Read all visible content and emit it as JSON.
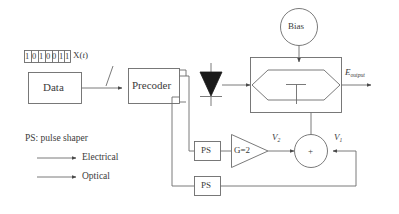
{
  "figure": {
    "type": "block-diagram"
  },
  "blocks": {
    "data": {
      "label": "Data"
    },
    "precoder": {
      "label": "Precoder"
    },
    "bias": {
      "label": "Bias"
    },
    "ps_upper": {
      "label": "PS"
    },
    "ps_lower": {
      "label": "PS"
    },
    "amplifier": {
      "label": "G=2",
      "gain": 2
    },
    "summer": {
      "label": "+"
    },
    "laser": {
      "name": "laser-diode"
    },
    "modulator": {
      "name": "mach-zehnder-modulator"
    }
  },
  "signals": {
    "bitstream": [
      "1",
      "0",
      "1",
      "0",
      "0",
      "1",
      "1"
    ],
    "bitstream_label": "X(t)",
    "bitstream_label_base": "X",
    "bitstream_label_var": "t",
    "v2_base": "V",
    "v2_sub": "2",
    "v1_base": "V",
    "v1_sub": "1",
    "output_base": "E",
    "output_sub": "output"
  },
  "legend": {
    "abbreviation": "PS: pulse shaper",
    "items": [
      {
        "label": "Electrical",
        "kind": "electrical-arrow"
      },
      {
        "label": "Optical",
        "kind": "optical-arrow"
      }
    ]
  },
  "colors": {
    "stroke": "#6b6b6b",
    "text": "#3b3b3b",
    "fill": "#ffffff",
    "laser_fill": "#1a1a1a",
    "background": "#ffffff"
  }
}
